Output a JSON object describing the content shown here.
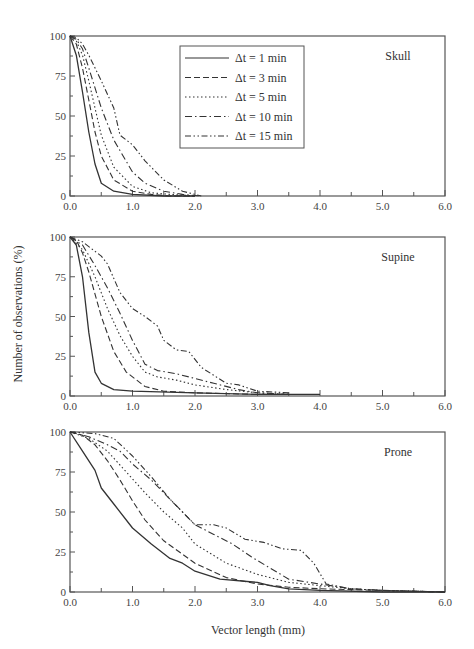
{
  "chart_data": {
    "type": "line",
    "xlabel": "Vector length (mm)",
    "ylabel": "Number of observations (%)",
    "xlim": [
      0,
      6
    ],
    "ylim": [
      0,
      100
    ],
    "x_ticks": [
      "0.0",
      "1.0",
      "2.0",
      "3.0",
      "4.0",
      "5.0",
      "6.0"
    ],
    "y_ticks": [
      "0",
      "25",
      "50",
      "75",
      "100"
    ],
    "grid": false,
    "legend": {
      "position": "upper-center (top panel)",
      "entries": [
        "Δt = 1 min",
        "Δt = 3 min",
        "Δt = 5 min",
        "Δt = 10 min",
        "Δt = 15 min"
      ],
      "styles": [
        "solid",
        "dashed",
        "dotted",
        "dash-dot",
        "dash-dot-dot"
      ]
    },
    "panels": [
      {
        "label": "Skull",
        "series": [
          {
            "name": "Δt = 1 min",
            "x": [
              0,
              0.1,
              0.2,
              0.3,
              0.4,
              0.5,
              0.7,
              1.0,
              1.5,
              2.0
            ],
            "y": [
              100,
              88,
              65,
              40,
              20,
              8,
              3,
              1,
              0,
              0
            ]
          },
          {
            "name": "Δt = 3 min",
            "x": [
              0,
              0.1,
              0.2,
              0.3,
              0.4,
              0.5,
              0.7,
              1.0,
              1.3,
              1.6,
              2.0
            ],
            "y": [
              100,
              95,
              80,
              60,
              40,
              25,
              10,
              3,
              1,
              0,
              0
            ]
          },
          {
            "name": "Δt = 5 min",
            "x": [
              0,
              0.1,
              0.2,
              0.3,
              0.4,
              0.5,
              0.7,
              1.0,
              1.3,
              1.6,
              2.0
            ],
            "y": [
              100,
              97,
              88,
              72,
              55,
              38,
              18,
              6,
              2,
              1,
              0
            ]
          },
          {
            "name": "Δt = 10 min",
            "x": [
              0,
              0.1,
              0.2,
              0.3,
              0.5,
              0.7,
              1.0,
              1.2,
              1.5,
              1.8,
              2.1
            ],
            "y": [
              100,
              98,
              92,
              80,
              55,
              35,
              15,
              8,
              3,
              1,
              0
            ]
          },
          {
            "name": "Δt = 15 min",
            "x": [
              0,
              0.1,
              0.2,
              0.3,
              0.5,
              0.7,
              0.8,
              1.0,
              1.2,
              1.5,
              1.8,
              2.1
            ],
            "y": [
              100,
              99,
              95,
              88,
              72,
              55,
              38,
              32,
              22,
              10,
              3,
              0
            ]
          }
        ]
      },
      {
        "label": "Supine",
        "series": [
          {
            "name": "Δt = 1 min",
            "x": [
              0,
              0.1,
              0.2,
              0.3,
              0.4,
              0.5,
              0.7,
              1.0,
              2.0,
              3.0,
              4.0
            ],
            "y": [
              100,
              95,
              75,
              40,
              15,
              8,
              4,
              3,
              2,
              1,
              1
            ]
          },
          {
            "name": "Δt = 3 min",
            "x": [
              0,
              0.1,
              0.2,
              0.3,
              0.5,
              0.7,
              0.9,
              1.2,
              1.5,
              2.0,
              3.0,
              3.5
            ],
            "y": [
              100,
              98,
              90,
              78,
              50,
              28,
              15,
              6,
              3,
              2,
              1,
              1
            ]
          },
          {
            "name": "Δt = 5 min",
            "x": [
              0,
              0.2,
              0.4,
              0.6,
              0.8,
              1.0,
              1.2,
              1.4,
              1.7,
              2.0,
              2.5,
              3.0,
              3.5
            ],
            "y": [
              100,
              92,
              75,
              55,
              38,
              25,
              15,
              12,
              10,
              7,
              4,
              2,
              1
            ]
          },
          {
            "name": "Δt = 10 min",
            "x": [
              0,
              0.2,
              0.4,
              0.6,
              0.8,
              1.0,
              1.2,
              1.4,
              1.7,
              2.0,
              2.3,
              2.7,
              3.0,
              3.5
            ],
            "y": [
              100,
              95,
              82,
              68,
              52,
              35,
              20,
              16,
              14,
              11,
              8,
              4,
              2,
              1
            ]
          },
          {
            "name": "Δt = 15 min",
            "x": [
              0,
              0.2,
              0.5,
              0.6,
              0.8,
              1.0,
              1.2,
              1.4,
              1.5,
              1.7,
              1.9,
              2.1,
              2.5,
              2.7,
              3.0,
              3.5
            ],
            "y": [
              100,
              97,
              88,
              83,
              65,
              55,
              50,
              44,
              35,
              29,
              28,
              18,
              8,
              7,
              3,
              2
            ]
          }
        ]
      },
      {
        "label": "Prone",
        "series": [
          {
            "name": "Δt = 1 min",
            "x": [
              0,
              0.2,
              0.4,
              0.5,
              0.7,
              1.0,
              1.3,
              1.6,
              1.8,
              2.0,
              2.4,
              3.0,
              3.2,
              3.5,
              4.0,
              5.0,
              6.0
            ],
            "y": [
              100,
              88,
              76,
              65,
              55,
              40,
              30,
              21,
              18,
              13,
              8,
              6,
              4,
              2,
              1,
              0,
              0
            ]
          },
          {
            "name": "Δt = 3 min",
            "x": [
              0,
              0.2,
              0.4,
              0.6,
              0.8,
              1.0,
              1.2,
              1.5,
              2.0,
              2.5,
              3.0,
              3.5,
              4.0,
              5.0,
              6.0
            ],
            "y": [
              100,
              98,
              92,
              82,
              70,
              57,
              45,
              32,
              18,
              9,
              5,
              3,
              2,
              1,
              0
            ]
          },
          {
            "name": "Δt = 5 min",
            "x": [
              0,
              0.3,
              0.6,
              0.9,
              1.2,
              1.5,
              1.8,
              2.0,
              2.5,
              3.0,
              3.5,
              4.0,
              4.5,
              5.0,
              6.0
            ],
            "y": [
              100,
              96,
              88,
              75,
              62,
              50,
              40,
              30,
              18,
              11,
              6,
              4,
              2,
              1,
              0
            ]
          },
          {
            "name": "Δt = 10 min",
            "x": [
              0,
              0.3,
              0.6,
              0.8,
              1.0,
              1.3,
              1.6,
              2.0,
              2.3,
              2.6,
              2.9,
              3.2,
              3.5,
              4.0,
              4.5,
              5.0,
              6.0
            ],
            "y": [
              100,
              97,
              92,
              88,
              80,
              70,
              58,
              42,
              36,
              30,
              22,
              15,
              8,
              5,
              2,
              1,
              0
            ]
          },
          {
            "name": "Δt = 15 min",
            "x": [
              0,
              0.4,
              0.7,
              1.0,
              1.3,
              1.6,
              1.8,
              2.0,
              2.3,
              2.5,
              2.8,
              3.1,
              3.4,
              3.7,
              3.9,
              4.1,
              4.5,
              5.0,
              6.0
            ],
            "y": [
              100,
              99,
              96,
              85,
              72,
              58,
              50,
              42,
              42,
              40,
              33,
              31,
              27,
              26,
              18,
              5,
              2,
              1,
              0
            ]
          }
        ]
      }
    ]
  }
}
